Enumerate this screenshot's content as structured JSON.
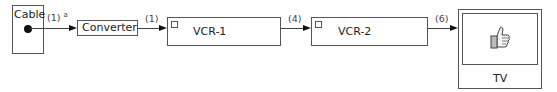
{
  "diagram": {
    "nodes": {
      "cable": {
        "label": "Cable"
      },
      "converter": {
        "label": "Converter"
      },
      "vcr1": {
        "label": "VCR-1"
      },
      "vcr2": {
        "label": "VCR-2"
      },
      "tv": {
        "label": "TV",
        "screen_icon": "thumbs-up"
      }
    },
    "connections": [
      {
        "from": "Cable",
        "to": "Converter",
        "label": "(1)",
        "footnote": "a"
      },
      {
        "from": "Converter",
        "to": "VCR-1",
        "label": "(1)"
      },
      {
        "from": "VCR-1",
        "to": "VCR-2",
        "label": "(4)"
      },
      {
        "from": "VCR-2",
        "to": "TV",
        "label": "(6)"
      }
    ],
    "colors": {
      "line": "#444444",
      "border": "#555555",
      "background": "#ffffff"
    }
  }
}
